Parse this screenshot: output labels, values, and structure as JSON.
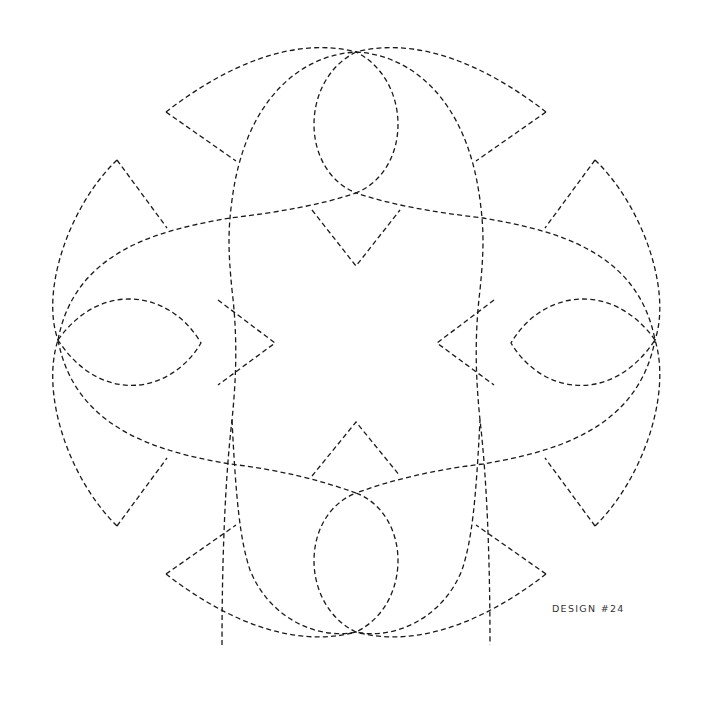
{
  "design": {
    "label": "DESIGN #24",
    "stroke_color": "#1a1a1a",
    "background": "#ffffff",
    "line_style": "dashed"
  }
}
